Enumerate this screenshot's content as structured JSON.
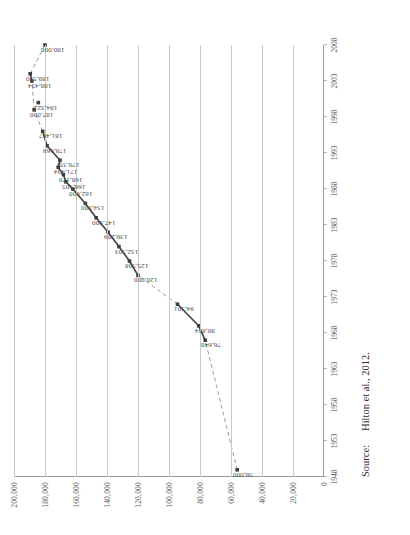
{
  "figure": {
    "source_label": "Source:",
    "source_text": "Hilton et al., 2012."
  },
  "chart_data": {
    "type": "line",
    "title": "",
    "xlabel": "",
    "ylabel": "",
    "ylim": [
      0,
      200000
    ],
    "xlim": [
      1948,
      2008
    ],
    "grid": true,
    "legend": false,
    "y_ticks": [
      "0",
      "20,000",
      "40,000",
      "60,000",
      "80,000",
      "100,000",
      "120,000",
      "140,000",
      "160,000",
      "180,000",
      "200,000"
    ],
    "y_tick_values": [
      0,
      20000,
      40000,
      60000,
      80000,
      100000,
      120000,
      140000,
      160000,
      180000,
      200000
    ],
    "x_ticks": [
      "1948",
      "1953",
      "1958",
      "1963",
      "1968",
      "1973",
      "1978",
      "1983",
      "1988",
      "1993",
      "1998",
      "2003",
      "2008"
    ],
    "x_tick_values": [
      1948,
      1953,
      1958,
      1963,
      1968,
      1973,
      1978,
      1983,
      1988,
      1993,
      1998,
      2003,
      2008
    ],
    "marker": "square",
    "marker_color": "#404040",
    "line_color": "#404040",
    "gap_line_style": "dashed",
    "points": [
      {
        "x": 1949,
        "y": 56000,
        "label": "56,000",
        "gap_before": false
      },
      {
        "x": 1967,
        "y": 76648,
        "label": "76,648",
        "gap_before": true
      },
      {
        "x": 1969,
        "y": 80834,
        "label": "80,834",
        "gap_before": false
      },
      {
        "x": 1972,
        "y": 94501,
        "label": "94,501",
        "gap_before": false
      },
      {
        "x": 1976,
        "y": 120000,
        "label": "120,000",
        "gap_before": true
      },
      {
        "x": 1978,
        "y": 125508,
        "label": "125,508",
        "gap_before": false
      },
      {
        "x": 1980,
        "y": 132303,
        "label": "132,303",
        "gap_before": false
      },
      {
        "x": 1982,
        "y": 139289,
        "label": "139,289",
        "gap_before": false
      },
      {
        "x": 1984,
        "y": 147000,
        "label": "147,000",
        "gap_before": false
      },
      {
        "x": 1986,
        "y": 154000,
        "label": "154,000",
        "gap_before": false
      },
      {
        "x": 1988,
        "y": 162000,
        "label": "162,000",
        "gap_before": false
      },
      {
        "x": 1989,
        "y": 166505,
        "label": "166,505",
        "gap_before": false
      },
      {
        "x": 1990,
        "y": 168170,
        "label": "168,170",
        "gap_before": false
      },
      {
        "x": 1991,
        "y": 171434,
        "label": "171,434",
        "gap_before": false
      },
      {
        "x": 1992,
        "y": 170357,
        "label": "170,357",
        "gap_before": false
      },
      {
        "x": 1994,
        "y": 178669,
        "label": "178,669",
        "gap_before": false
      },
      {
        "x": 1996,
        "y": 181467,
        "label": "181,467",
        "gap_before": false
      },
      {
        "x": 1999,
        "y": 187000,
        "label": "187,000",
        "gap_before": true
      },
      {
        "x": 2003,
        "y": 188454,
        "label": "188,454",
        "gap_before": true
      },
      {
        "x": 2004,
        "y": 189530,
        "label": "189,530",
        "gap_before": false
      },
      {
        "x": 2008,
        "y": 180000,
        "label": "180,000",
        "gap_before": true
      }
    ],
    "secondary_points": [
      {
        "x": 2000,
        "y": 184322,
        "label": "184,322"
      }
    ]
  }
}
